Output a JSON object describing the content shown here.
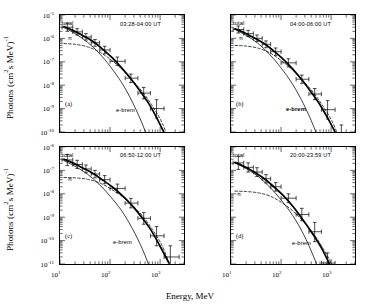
{
  "figure": {
    "axis_labels": {
      "x": "Energy, MeV",
      "y_prefix": "Photons (cm",
      "y_sup1": "2",
      "y_mid": "s MeV)",
      "y_sup2": "-1"
    },
    "x_ticks": [
      {
        "mant": "10",
        "exp": "1"
      },
      {
        "mant": "10",
        "exp": "2"
      },
      {
        "mant": "10",
        "exp": "3"
      }
    ],
    "y_ticks_top": [
      {
        "mant": "10",
        "exp": "-5"
      },
      {
        "mant": "10",
        "exp": "-6"
      },
      {
        "mant": "10",
        "exp": "-7"
      },
      {
        "mant": "10",
        "exp": "-8"
      },
      {
        "mant": "10",
        "exp": "-9"
      },
      {
        "mant": "10",
        "exp": "-10"
      }
    ],
    "y_ticks_bottom": [
      {
        "mant": "10",
        "exp": "-6"
      },
      {
        "mant": "10",
        "exp": "-7"
      },
      {
        "mant": "10",
        "exp": "-8"
      },
      {
        "mant": "10",
        "exp": "-9"
      },
      {
        "mant": "10",
        "exp": "-10"
      },
      {
        "mant": "10",
        "exp": "-11"
      }
    ],
    "curve_labels": {
      "total": "total",
      "pion": "π",
      "ebrem": "e-brem"
    }
  },
  "panels": [
    {
      "id": "a",
      "letter": "(a)",
      "time": "03:28-04:00 UT",
      "ebrem_bold": false
    },
    {
      "id": "b",
      "letter": "(b)",
      "time": "04:00-06:00 UT",
      "ebrem_bold": true
    },
    {
      "id": "c",
      "letter": "(c)",
      "time": "06:50-12:00 UT",
      "ebrem_bold": false
    },
    {
      "id": "d",
      "letter": "(d)",
      "time": "20:00-23:59 UT",
      "ebrem_bold": false
    }
  ],
  "chart_data": {
    "type": "line",
    "xlabel": "Energy, MeV",
    "ylabel": "Photons (cm^2 s MeV)^-1",
    "xscale": "log",
    "yscale": "log",
    "xlim": [
      10,
      3000
    ],
    "grid": false,
    "legend": "inline annotations: total, π, e-brem",
    "panels": [
      {
        "id": "a",
        "label": "(a)",
        "time_interval": "03:28-04:00 UT",
        "ylim": [
          1e-10,
          1e-05
        ],
        "series": [
          {
            "name": "total",
            "style": "solid-thick",
            "x": [
              12,
              18,
              28,
              45,
              70,
              110,
              170,
              260,
              400,
              620,
              950,
              1500
            ],
            "y": [
              3.2e-06,
              2.2e-06,
              1.35e-06,
              7.5e-07,
              3.6e-07,
              1.5e-07,
              5.5e-08,
              1.9e-08,
              5.5e-09,
              1.4e-09,
              2.6e-10,
              3.5e-11
            ]
          },
          {
            "name": "π",
            "style": "dashed",
            "x": [
              12,
              20,
              35,
              60,
              100,
              170,
              280,
              450,
              700,
              1100,
              1600
            ],
            "y": [
              6e-07,
              5.6e-07,
              4.4e-07,
              2.7e-07,
              1.3e-07,
              5e-08,
              1.6e-08,
              5e-09,
              1.3e-09,
              2.4e-10,
              3e-11
            ]
          },
          {
            "name": "e-brem",
            "style": "thin-solid",
            "x": [
              12,
              20,
              35,
              60,
              100,
              170,
              280,
              450,
              700,
              1000
            ],
            "y": [
              2.9e-06,
              1.6e-06,
              7e-07,
              2.4e-07,
              6.5e-08,
              1.3e-08,
              1.9e-09,
              2e-10,
              1.6e-11,
              2e-12
            ]
          }
        ],
        "points": [
          {
            "x": 14,
            "y": 3e-06,
            "xerr": [
              11,
              18
            ],
            "yerr": [
              2e-06,
              4.4e-06
            ]
          },
          {
            "x": 22,
            "y": 1.9e-06,
            "xerr": [
              18,
              28
            ],
            "yerr": [
              1.4e-06,
              2.6e-06
            ]
          },
          {
            "x": 33,
            "y": 1.15e-06,
            "xerr": [
              28,
              42
            ],
            "yerr": [
              8.5e-07,
              1.6e-06
            ]
          },
          {
            "x": 50,
            "y": 6.5e-07,
            "xerr": [
              42,
              62
            ],
            "yerr": [
              4.6e-07,
              9e-07
            ]
          },
          {
            "x": 78,
            "y": 3.2e-07,
            "xerr": [
              62,
              100
            ],
            "yerr": [
              2.2e-07,
              4.6e-07
            ]
          },
          {
            "x": 140,
            "y": 1.05e-07,
            "xerr": [
              100,
              200
            ],
            "yerr": [
              7e-08,
              1.6e-07
            ]
          },
          {
            "x": 260,
            "y": 2e-08,
            "xerr": [
              200,
              360
            ],
            "yerr": [
              1.3e-08,
              3e-08
            ]
          },
          {
            "x": 470,
            "y": 4.6e-09,
            "xerr": [
              360,
              640
            ],
            "yerr": [
              2.6e-09,
              8e-09
            ]
          },
          {
            "x": 850,
            "y": 1e-09,
            "xerr": [
              640,
              1200
            ],
            "yerr": [
              4e-10,
              2.4e-09
            ]
          }
        ]
      },
      {
        "id": "b",
        "label": "(b)",
        "time_interval": "04:00-06:00 UT",
        "ylim": [
          1e-10,
          1e-05
        ],
        "series": [
          {
            "name": "total",
            "style": "solid-thick",
            "x": [
              12,
              18,
              28,
              45,
              70,
              110,
              170,
              260,
              400,
              620,
              950,
              1500
            ],
            "y": [
              2.6e-06,
              1.8e-06,
              1.1e-06,
              6.2e-07,
              3e-07,
              1.3e-07,
              5e-08,
              1.7e-08,
              5e-09,
              1.3e-09,
              2.6e-10,
              4e-11
            ]
          },
          {
            "name": "π",
            "style": "dashed",
            "x": [
              12,
              20,
              35,
              60,
              100,
              170,
              280,
              450,
              700,
              1100,
              1600
            ],
            "y": [
              5e-07,
              4.7e-07,
              3.8e-07,
              2.4e-07,
              1.15e-07,
              4.5e-08,
              1.5e-08,
              4.6e-09,
              1.2e-09,
              2.3e-10,
              3e-11
            ]
          },
          {
            "name": "e-brem",
            "style": "thin-solid",
            "x": [
              12,
              20,
              35,
              60,
              100,
              170,
              280,
              450,
              700,
              1000
            ],
            "y": [
              2.4e-06,
              1.35e-06,
              6e-07,
              2e-07,
              5.5e-08,
              1.1e-08,
              1.6e-09,
              1.7e-10,
              1.4e-11,
              1.8e-12
            ]
          }
        ],
        "points": [
          {
            "x": 14,
            "y": 2.4e-06,
            "xerr": [
              11,
              18
            ],
            "yerr": [
              1.7e-06,
              3.4e-06
            ]
          },
          {
            "x": 22,
            "y": 1.6e-06,
            "xerr": [
              18,
              28
            ],
            "yerr": [
              1.2e-06,
              2.2e-06
            ]
          },
          {
            "x": 33,
            "y": 1e-06,
            "xerr": [
              28,
              42
            ],
            "yerr": [
              7.4e-07,
              1.4e-06
            ]
          },
          {
            "x": 50,
            "y": 5.6e-07,
            "xerr": [
              42,
              62
            ],
            "yerr": [
              4e-07,
              7.8e-07
            ]
          },
          {
            "x": 78,
            "y": 2.7e-07,
            "xerr": [
              62,
              100
            ],
            "yerr": [
              1.9e-07,
              3.9e-07
            ]
          },
          {
            "x": 140,
            "y": 9e-08,
            "xerr": [
              100,
              200
            ],
            "yerr": [
              6e-08,
              1.35e-07
            ]
          },
          {
            "x": 260,
            "y": 1.8e-08,
            "xerr": [
              200,
              360
            ],
            "yerr": [
              1.2e-08,
              2.7e-08
            ]
          },
          {
            "x": 470,
            "y": 4.2e-09,
            "xerr": [
              360,
              640
            ],
            "yerr": [
              2.4e-09,
              7.2e-09
            ]
          },
          {
            "x": 850,
            "y": 9e-10,
            "xerr": [
              640,
              1200
            ],
            "yerr": [
              3.6e-10,
              2.2e-09
            ]
          },
          {
            "x": 1600,
            "y": 7e-11,
            "xerr": [
              1200,
              2400
            ],
            "yerr": [
              2.5e-11,
              2e-10
            ]
          }
        ]
      },
      {
        "id": "c",
        "label": "(c)",
        "time_interval": "06:50-12:00 UT",
        "ylim": [
          1e-11,
          1e-06
        ],
        "series": [
          {
            "name": "total",
            "style": "solid-thick",
            "x": [
              12,
              18,
              28,
              45,
              70,
              110,
              170,
              260,
              400,
              620,
              950,
              1500
            ],
            "y": [
              3e-07,
              2.1e-07,
              1.3e-07,
              7.5e-08,
              4e-08,
              2e-08,
              9e-09,
              3.6e-09,
              1.2e-09,
              3.4e-10,
              7e-11,
              1.1e-11
            ]
          },
          {
            "name": "π",
            "style": "dashed",
            "x": [
              12,
              20,
              35,
              60,
              100,
              170,
              280,
              450,
              700,
              1100,
              1600
            ],
            "y": [
              5e-08,
              4.8e-08,
              4.2e-08,
              3e-08,
              1.7e-08,
              8e-09,
              3.2e-09,
              1.1e-09,
              3e-10,
              6e-11,
              8e-12
            ]
          },
          {
            "name": "e-brem",
            "style": "thin-solid",
            "x": [
              12,
              20,
              35,
              60,
              100,
              170,
              280,
              450,
              700,
              1000
            ],
            "y": [
              2.6e-07,
              1.5e-07,
              7e-08,
              2.6e-08,
              8e-09,
              1.9e-09,
              3.2e-10,
              4e-11,
              3.6e-12,
              5e-13
            ]
          }
        ],
        "points": [
          {
            "x": 14,
            "y": 2.8e-07,
            "xerr": [
              11,
              18
            ],
            "yerr": [
              1.6e-07,
              4.8e-07
            ]
          },
          {
            "x": 22,
            "y": 1.8e-07,
            "xerr": [
              18,
              28
            ],
            "yerr": [
              1.2e-07,
              2.7e-07
            ]
          },
          {
            "x": 33,
            "y": 1.15e-07,
            "xerr": [
              28,
              42
            ],
            "yerr": [
              8e-08,
              1.7e-07
            ]
          },
          {
            "x": 50,
            "y": 7e-08,
            "xerr": [
              42,
              62
            ],
            "yerr": [
              4.8e-08,
              1e-07
            ]
          },
          {
            "x": 78,
            "y": 4e-08,
            "xerr": [
              62,
              100
            ],
            "yerr": [
              2.7e-08,
              6e-08
            ]
          },
          {
            "x": 140,
            "y": 1.7e-08,
            "xerr": [
              100,
              200
            ],
            "yerr": [
              1.1e-08,
              2.6e-08
            ]
          },
          {
            "x": 260,
            "y": 4e-09,
            "xerr": [
              200,
              360
            ],
            "yerr": [
              2.5e-09,
              6.4e-09
            ]
          },
          {
            "x": 470,
            "y": 9e-10,
            "xerr": [
              360,
              640
            ],
            "yerr": [
              5e-10,
              1.6e-09
            ]
          },
          {
            "x": 850,
            "y": 1.6e-10,
            "xerr": [
              640,
              1200
            ],
            "yerr": [
              6e-11,
              4e-10
            ]
          },
          {
            "x": 1600,
            "y": 2e-11,
            "xerr": [
              1200,
              2400
            ],
            "yerr": [
              6e-12,
              6e-11
            ]
          }
        ]
      },
      {
        "id": "d",
        "label": "(d)",
        "time_interval": "20:00-23:59 UT",
        "ylim": [
          1e-11,
          1e-06
        ],
        "series": [
          {
            "name": "total",
            "style": "solid-thick",
            "x": [
              12,
              18,
              28,
              45,
              70,
              110,
              170,
              260,
              400,
              620,
              950,
              1300
            ],
            "y": [
              2.2e-07,
              1.5e-07,
              9e-08,
              4.6e-08,
              2.1e-08,
              8.5e-09,
              3e-09,
              9e-10,
              2.4e-10,
              5.5e-11,
              9e-12,
              2e-12
            ]
          },
          {
            "name": "π",
            "style": "dashed",
            "x": [
              12,
              20,
              35,
              60,
              100,
              170,
              280,
              450,
              700,
              1000,
              1300
            ],
            "y": [
              1.3e-08,
              1.25e-08,
              1.1e-08,
              8e-09,
              4.4e-09,
              1.9e-09,
              6.5e-10,
              1.9e-10,
              4.4e-11,
              1.1e-11,
              3e-12
            ]
          },
          {
            "name": "e-brem",
            "style": "thin-solid",
            "x": [
              12,
              20,
              35,
              60,
              100,
              170,
              280,
              450,
              700,
              1000
            ],
            "y": [
              2.1e-07,
              1.2e-07,
              5.5e-08,
              1.9e-08,
              5.5e-09,
              1.2e-09,
              1.9e-10,
              2e-11,
              1.7e-12,
              2.2e-13
            ]
          }
        ],
        "points": [
          {
            "x": 14,
            "y": 2.1e-07,
            "xerr": [
              11,
              18
            ],
            "yerr": [
              1.1e-07,
              4e-07
            ]
          },
          {
            "x": 22,
            "y": 1.35e-07,
            "xerr": [
              18,
              28
            ],
            "yerr": [
              8.5e-08,
              2.1e-07
            ]
          },
          {
            "x": 33,
            "y": 8.5e-08,
            "xerr": [
              28,
              42
            ],
            "yerr": [
              5.5e-08,
              1.3e-07
            ]
          },
          {
            "x": 50,
            "y": 4.4e-08,
            "xerr": [
              42,
              62
            ],
            "yerr": [
              2.9e-08,
              6.6e-08
            ]
          },
          {
            "x": 78,
            "y": 2e-08,
            "xerr": [
              62,
              100
            ],
            "yerr": [
              1.3e-08,
              3e-08
            ]
          },
          {
            "x": 140,
            "y": 6.5e-09,
            "xerr": [
              100,
              200
            ],
            "yerr": [
              4.2e-09,
              1e-08
            ]
          },
          {
            "x": 260,
            "y": 1.3e-09,
            "xerr": [
              200,
              360
            ],
            "yerr": [
              7e-10,
              2.4e-09
            ]
          },
          {
            "x": 470,
            "y": 2.4e-10,
            "xerr": [
              360,
              640
            ],
            "yerr": [
              9e-11,
              6e-10
            ]
          },
          {
            "x": 850,
            "y": 1.1e-11,
            "xerr": [
              640,
              1200
            ],
            "yerr": [
              4e-12,
              3e-11
            ]
          }
        ]
      }
    ]
  }
}
